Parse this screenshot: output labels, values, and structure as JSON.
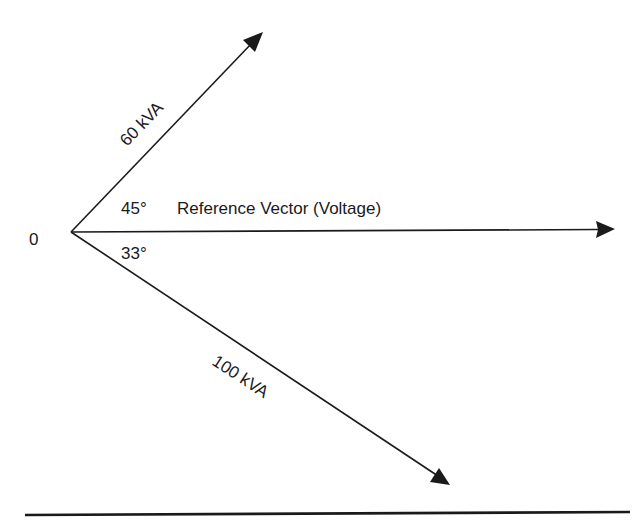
{
  "diagram": {
    "type": "phasor-diagram",
    "origin_label": "0",
    "reference_vector": {
      "label": "Reference Vector (Voltage)"
    },
    "vectors": [
      {
        "label": "60 kVA",
        "angle_label": "45°",
        "direction": "leading"
      },
      {
        "label": "100 kVA",
        "angle_label": "33°",
        "direction": "lagging"
      }
    ],
    "colors": {
      "line": "#1a1a1a",
      "background": "#ffffff"
    }
  }
}
